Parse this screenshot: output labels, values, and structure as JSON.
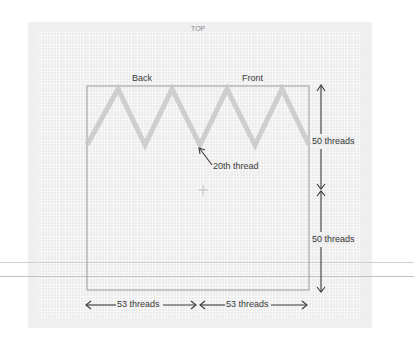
{
  "diagram": {
    "top_label": "TOP",
    "labels": {
      "back": "Back",
      "front": "Front",
      "pointer": "20th thread"
    },
    "dimensions": {
      "vertical_upper": "50 threads",
      "vertical_lower": "50 threads",
      "horizontal_left": "53 threads",
      "horizontal_right": "53 threads"
    },
    "colors": {
      "background": "#ffffff",
      "panel": "#efefef",
      "grid": "#ececec",
      "zigzag": "#c8c8c8",
      "rectangle": "#9a9a9a",
      "arrows": "#3a3a3a",
      "text": "#3a3a3a"
    },
    "zigzag": {
      "peaks": 4,
      "valleys": 5,
      "color_name": "light-gray-stitch"
    },
    "center_mark": "crosshair"
  }
}
